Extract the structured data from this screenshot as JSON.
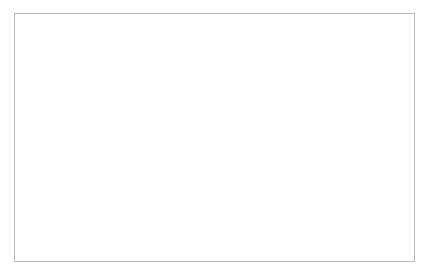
{
  "chart_data": {
    "type": "line",
    "title": "",
    "xlabel": "",
    "ylabel": "All crashes (N)",
    "y2label": "Animal-vehicle collisions (N)",
    "grid": false,
    "legend_position": "inside-bottom-center",
    "x": [
      1990,
      1991,
      1992,
      1993,
      1994,
      1995,
      1996,
      1997,
      1998,
      1999,
      2000,
      2001,
      2002,
      2003,
      2004
    ],
    "xlim": [
      1989.5,
      2004.5
    ],
    "xticks": [
      1990,
      1992,
      1994,
      1996,
      1998,
      2000,
      2002,
      2004
    ],
    "xticklabels": [
      "1990",
      "1992",
      "1994",
      "1996",
      "1998",
      "2000",
      "2002",
      "2004"
    ],
    "ylim": [
      0,
      8000000
    ],
    "yticks": [
      0,
      1000000,
      2000000,
      3000000,
      4000000,
      5000000,
      6000000,
      7000000,
      8000000
    ],
    "yticklabels": [
      "0",
      "1,000,000",
      "2,000,000",
      "3,000,000",
      "4,000,000",
      "5,000,000",
      "6,000,000",
      "7,000,000",
      "8,000,000"
    ],
    "y2lim": [
      0,
      350000
    ],
    "y2ticks": [
      0,
      50000,
      100000,
      150000,
      200000,
      250000,
      300000,
      350000
    ],
    "y2ticklabels": [
      "0",
      "50,000",
      "100,000",
      "150,000",
      "200,000",
      "250,000",
      "300,000",
      "350,000"
    ],
    "series": [
      {
        "name": "All crashes",
        "axis": "left",
        "marker": "open-circle",
        "color": "#000000",
        "values": [
          6480000,
          6120000,
          6010000,
          6080000,
          6510000,
          6720000,
          6760000,
          6630000,
          6330000,
          6280000,
          6390000,
          6310000,
          6320000,
          6320000,
          6180000
        ]
      },
      {
        "name": "Animal-vehicle collisions",
        "axis": "right",
        "marker": "filled-circle",
        "color": "#000000",
        "values": [
          187000,
          200000,
          219000,
          225000,
          244000,
          266000,
          262000,
          259000,
          259000,
          268000,
          258000,
          291000,
          298000,
          315000,
          300000
        ]
      }
    ]
  },
  "legend": {
    "items": [
      {
        "label": "All crashes",
        "marker": "open-circle"
      },
      {
        "label": "Animal-vehicle collisions",
        "marker": "filled-circle"
      }
    ]
  }
}
